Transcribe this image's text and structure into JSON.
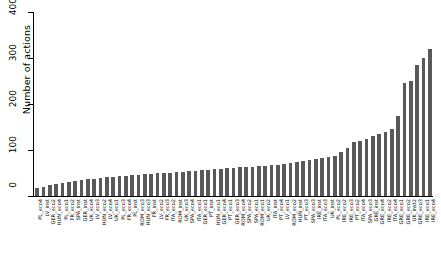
{
  "chart_data": {
    "type": "bar",
    "title": "",
    "subtitle": "",
    "xlabel": "",
    "ylabel": "Number of actions",
    "ylim": [
      0,
      400
    ],
    "yticks": [
      0,
      100,
      200,
      300,
      400
    ],
    "grid": false,
    "legend": null,
    "bar_color": "#595959",
    "orientation": "vertical",
    "sorted": "ascending",
    "categories": [
      "PL_eco4",
      "LV_inst",
      "GER_eco2",
      "HUN_eco4",
      "PL_eco1",
      "FR_eco2",
      "SPA_inst",
      "GER_inst",
      "UK_eco4",
      "LV_eco3",
      "HUN_eco2",
      "LV_eco4",
      "UK_eco1",
      "PL_eco3",
      "FR_eco4",
      "PL_inst",
      "ROM_eco3",
      "HUN_eco3",
      "FR_inst",
      "LV_eco2",
      "FR_eco3",
      "ITA_eco2",
      "ROM_inst",
      "UK_eco3",
      "SPA_eco4",
      "ITA_eco1",
      "GER_eco1",
      "PT_inst",
      "HUN_eco1",
      "GER_eco4",
      "PT_eco1",
      "GER_eco3",
      "ROM_eco4",
      "SPA_eco2",
      "SPA_eco1",
      "ROM_eco1",
      "UK_eco2",
      "ITA_inst",
      "PT_eco4",
      "LV_eco1",
      "ROM_eco2",
      "HUN_inst",
      "PT_eco3",
      "SPA_eco3",
      "IRE_inst",
      "ITA_eco3",
      "UK_inst",
      "PL_eco2",
      "IRE_eco2",
      "IRE_eco3",
      "PT_eco2",
      "ITA_eco4",
      "SPA_eco3b",
      "GRE_inst",
      "GRE_eco4",
      "IRE_eco2b",
      "ITA_eco4b",
      "GRE_eco1",
      "GRE_eco2",
      "UK_inst2",
      "GRE_eco3",
      "IRE_eco1",
      "IRE_eco4"
    ],
    "values": [
      18,
      20,
      24,
      26,
      28,
      30,
      32,
      34,
      36,
      38,
      40,
      41,
      42,
      43,
      44,
      45,
      46,
      47,
      48,
      49,
      50,
      51,
      52,
      53,
      54,
      55,
      56,
      57,
      58,
      59,
      60,
      61,
      62,
      63,
      64,
      65,
      66,
      67,
      68,
      70,
      72,
      74,
      76,
      78,
      80,
      82,
      84,
      88,
      95,
      105,
      118,
      120,
      125,
      130,
      135,
      140,
      145,
      175,
      245,
      250,
      285,
      300,
      320
    ]
  },
  "axis": {
    "y_tick_labels": [
      "0",
      "100",
      "200",
      "300",
      "400"
    ]
  }
}
